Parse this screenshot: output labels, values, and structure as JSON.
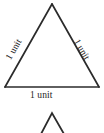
{
  "figure": {
    "type": "geometry-diagram",
    "line_color": "#2b2b2b",
    "background_color": "#ffffff",
    "text_color": "#1d1d1d",
    "main_triangle": {
      "name": "equilateral-triangle",
      "apex": {
        "x": 52,
        "y": 4
      },
      "bottom_left": {
        "x": 5,
        "y": 87
      },
      "bottom_right": {
        "x": 99,
        "y": 87
      },
      "labels": {
        "left_side": "1 unit",
        "right_side": "1 unit",
        "bottom_side": "1 unit"
      }
    },
    "partial_triangle": {
      "name": "second-triangle-apex",
      "apex": {
        "x": 52,
        "y": 113
      },
      "left_end": {
        "x": 41,
        "y": 133
      },
      "right_end": {
        "x": 64,
        "y": 133
      }
    }
  }
}
